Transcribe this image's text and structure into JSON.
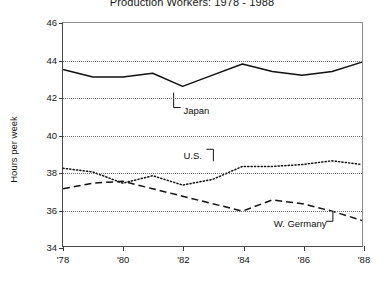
{
  "chart_data": {
    "type": "line",
    "title": "Production Workers: 1978 - 1988",
    "xlabel": "",
    "ylabel": "Hours per week",
    "x": [
      1978,
      1979,
      1980,
      1981,
      1982,
      1983,
      1984,
      1985,
      1986,
      1987,
      1988
    ],
    "tick_labels_x": [
      "'78",
      "'80",
      "'82",
      "'84",
      "'86",
      "'88"
    ],
    "tick_values_x": [
      1978,
      1980,
      1982,
      1984,
      1986,
      1988
    ],
    "tick_labels_y": [
      "34",
      "36",
      "38",
      "40",
      "42",
      "44",
      "46"
    ],
    "tick_values_y": [
      34,
      36,
      38,
      40,
      42,
      44,
      46
    ],
    "xlim": [
      1978,
      1988
    ],
    "ylim": [
      34,
      46
    ],
    "grid": "horizontal-dotted",
    "legend": "inline-annotations",
    "series": [
      {
        "name": "Japan",
        "style": "solid",
        "values": [
          43.5,
          43.1,
          43.1,
          43.3,
          42.6,
          43.2,
          43.8,
          43.4,
          43.2,
          43.4,
          43.9
        ]
      },
      {
        "name": "U.S.",
        "style": "dotted",
        "values": [
          38.2,
          38.0,
          37.4,
          37.8,
          37.3,
          37.6,
          38.3,
          38.3,
          38.4,
          38.6,
          38.4
        ]
      },
      {
        "name": "W. Germany",
        "style": "dashed",
        "values": [
          37.1,
          37.4,
          37.5,
          37.1,
          36.7,
          36.3,
          35.9,
          36.5,
          36.3,
          35.9,
          35.4
        ]
      }
    ],
    "annotations": [
      {
        "label": "Japan",
        "x": 1982,
        "y": 41.3
      },
      {
        "label": "U.S.",
        "x": 1982,
        "y": 38.9
      },
      {
        "label": "W. Germany",
        "x": 1985,
        "y": 35.3
      }
    ]
  }
}
